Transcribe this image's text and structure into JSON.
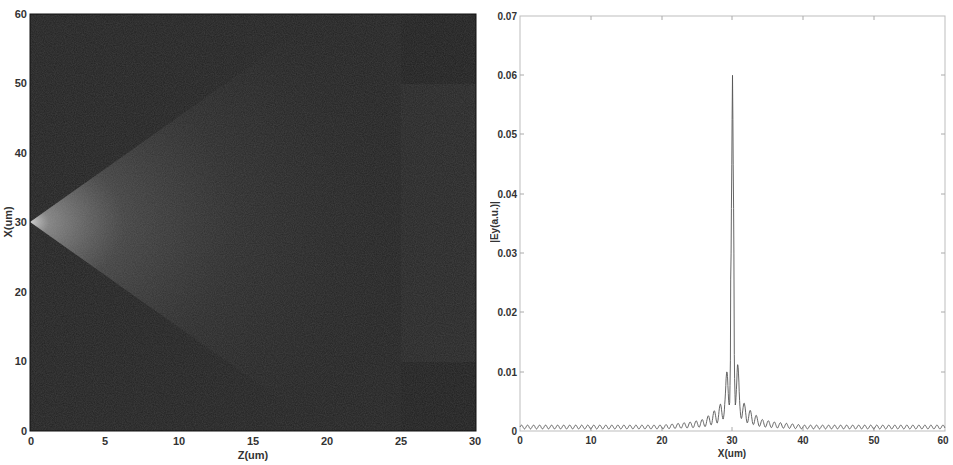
{
  "chart_data": [
    {
      "type": "heatmap",
      "title": "",
      "xlabel": "Z(um)",
      "ylabel": "X(um)",
      "xlim": [
        0,
        30
      ],
      "ylim": [
        0,
        60
      ],
      "xticks": [
        "0",
        "5",
        "10",
        "15",
        "20",
        "25",
        "30"
      ],
      "yticks": [
        "0",
        "10",
        "20",
        "30",
        "40",
        "50",
        "60"
      ],
      "grid": false,
      "description": "Field intensity |Ey| map: bright diverging beam source at Z=0, X=30, spreading into a fan toward Z≈25; darker region beyond Z≈25 between X≈10 and X≈50",
      "features": {
        "source": {
          "z": 0,
          "x": 30
        },
        "region_boundary_z": 25,
        "region_x_range": [
          10,
          50
        ]
      }
    },
    {
      "type": "line",
      "title": "",
      "xlabel": "X(um)",
      "ylabel": "|Ey(a.u.)|",
      "xlim": [
        0,
        60
      ],
      "ylim": [
        0,
        0.07
      ],
      "xticks": [
        "0",
        "10",
        "20",
        "30",
        "40",
        "50",
        "60"
      ],
      "yticks": [
        "0",
        "0.01",
        "0.02",
        "0.03",
        "0.04",
        "0.05",
        "0.06",
        "0.07"
      ],
      "grid": false,
      "series": [
        {
          "name": "|Ey|",
          "x": [
            0,
            5,
            10,
            15,
            20,
            24,
            26,
            27,
            28,
            28.5,
            29,
            29.3,
            29.6,
            29.8,
            30,
            30.2,
            30.4,
            30.7,
            31,
            31.5,
            32,
            33,
            34,
            36,
            40,
            45,
            50,
            55,
            60
          ],
          "values": [
            0.001,
            0.001,
            0.001,
            0.001,
            0.001,
            0.0015,
            0.002,
            0.003,
            0.004,
            0.005,
            0.007,
            0.0125,
            0.0125,
            0.03,
            0.06,
            0.03,
            0.0125,
            0.0125,
            0.007,
            0.005,
            0.004,
            0.003,
            0.002,
            0.0015,
            0.001,
            0.001,
            0.001,
            0.001,
            0.001
          ]
        }
      ],
      "annotations": {
        "peak": {
          "x": 30,
          "y": 0.06
        },
        "side_lobes": {
          "x": [
            29.4,
            30.6
          ],
          "y": 0.0125
        },
        "baseline_ripple": 0.001
      }
    }
  ],
  "left_plot": {
    "xlabel": "Z(um)",
    "ylabel": "X(um)",
    "xticks": [
      "0",
      "5",
      "10",
      "15",
      "20",
      "25",
      "30"
    ],
    "yticks": [
      "0",
      "10",
      "20",
      "30",
      "40",
      "50",
      "60"
    ]
  },
  "right_plot": {
    "xlabel": "X(um)",
    "ylabel": "|Ey(a.u.)|",
    "xticks": [
      "0",
      "10",
      "20",
      "30",
      "40",
      "50",
      "60"
    ],
    "yticks": [
      "0",
      "0.01",
      "0.02",
      "0.03",
      "0.04",
      "0.05",
      "0.06",
      "0.07"
    ]
  }
}
